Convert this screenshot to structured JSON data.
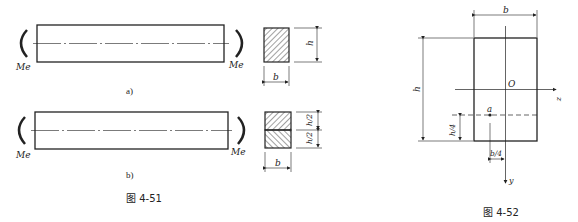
{
  "figures": [
    {
      "caption": "图 4-51",
      "subfigures": [
        {
          "label": "a)",
          "moment_left": "Me",
          "moment_right": "Me",
          "section": {
            "width_label": "b",
            "height_label": "h",
            "hatch": "single"
          }
        },
        {
          "label": "b)",
          "moment_left": "Me",
          "moment_right": "Me",
          "section": {
            "width_label": "b",
            "upper_height_label": "h/2",
            "lower_height_label": "h/2",
            "hatch": "split"
          }
        }
      ]
    },
    {
      "caption": "图 4-52",
      "width_label": "b",
      "height_label": "h",
      "origin_label": "O",
      "z_axis_label": "z",
      "y_axis_label": "y",
      "point_label": "a",
      "point_offset_y": "h/4",
      "point_offset_z": "b/4"
    }
  ],
  "colors": {
    "line": "#222222",
    "hatch": "#444444",
    "background": "#ffffff"
  }
}
